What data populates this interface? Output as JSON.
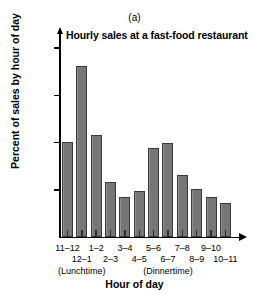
{
  "panel": {
    "label": "(a)"
  },
  "chart_data": {
    "type": "bar",
    "title": "Hourly sales at a fast-food restaurant",
    "xlabel": "Hour of day",
    "ylabel": "Percent of sales by hour of day",
    "categories": [
      "11–12",
      "12–1",
      "1–2",
      "2–3",
      "3–4",
      "4–5",
      "5–6",
      "6–7",
      "7–8",
      "8–9",
      "9–10",
      "10–11"
    ],
    "values": [
      10.0,
      18.0,
      10.7,
      5.8,
      4.2,
      4.8,
      9.4,
      9.9,
      6.5,
      5.0,
      4.2,
      3.5
    ],
    "ylim": [
      0,
      21.5
    ],
    "yticks": [
      5,
      10,
      15,
      20
    ],
    "ytick_labels": [
      "5%",
      "10%",
      "15%",
      "20%"
    ],
    "grid": false,
    "legend": null,
    "annotations": [
      {
        "text": "(Lunchtime)",
        "near_category": "12–1"
      },
      {
        "text": "(Dinnertime)",
        "near_category": "6–7"
      }
    ],
    "bar_color": "#7d7d7d",
    "bar_edge_color": "#3a3a3a",
    "axis_color": "#000000"
  }
}
